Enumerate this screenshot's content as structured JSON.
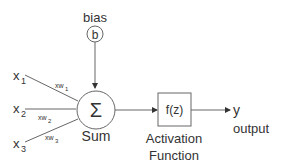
{
  "diagram": {
    "bias": {
      "label": "bias",
      "symbol": "b"
    },
    "inputs": [
      {
        "name": "x",
        "sub": "1",
        "weight": "xw",
        "weight_sub": "1"
      },
      {
        "name": "x",
        "sub": "2",
        "weight": "xw",
        "weight_sub": "2"
      },
      {
        "name": "x",
        "sub": "3",
        "weight": "xw",
        "weight_sub": "3"
      }
    ],
    "sum": {
      "symbol": "Σ",
      "label": "Sum"
    },
    "activation": {
      "symbol": "f(z)",
      "label_line1": "Activation",
      "label_line2": "Function"
    },
    "output": {
      "symbol": "y",
      "label": "output"
    },
    "colors": {
      "stroke": "#666666",
      "text": "#333333",
      "background": "#ffffff"
    }
  }
}
